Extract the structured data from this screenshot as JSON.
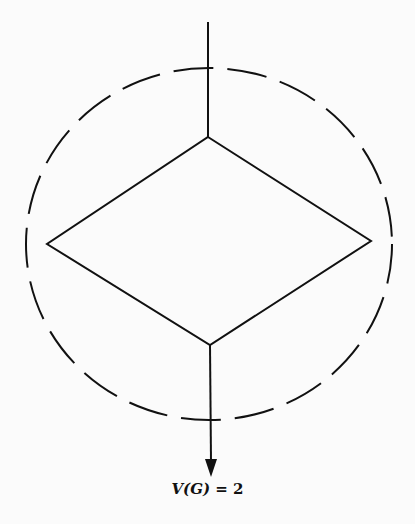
{
  "diagram": {
    "type": "flowgraph",
    "nodes": [
      {
        "id": "decision",
        "shape": "diamond",
        "top": [
          208,
          137
        ],
        "left": [
          47,
          244
        ],
        "right": [
          371,
          241
        ],
        "bottom": [
          210,
          345
        ]
      }
    ],
    "edges": [
      {
        "from": "entry",
        "to": "decision",
        "points": [
          [
            208,
            22
          ],
          [
            208,
            137
          ]
        ]
      },
      {
        "from": "decision",
        "to": "exit",
        "points": [
          [
            210,
            345
          ],
          [
            211,
            475
          ]
        ],
        "arrow": true
      }
    ],
    "region": {
      "shape": "ellipse",
      "cx": 209,
      "cy": 244,
      "rx": 183,
      "ry": 176,
      "style": "dashed"
    },
    "stroke_color": "#111111",
    "label": {
      "prefix": "V",
      "arg": "(G)",
      "rest": " = 2"
    }
  }
}
